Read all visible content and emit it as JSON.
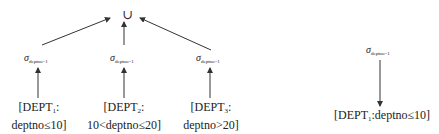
{
  "left_tree": {
    "root": {
      "symbol": "∪"
    },
    "selections": [
      {
        "sigma": "σ",
        "condition": "deptno=1"
      },
      {
        "sigma": "σ",
        "condition": "deptno=1"
      },
      {
        "sigma": "σ",
        "condition": "deptno=1"
      }
    ],
    "leaves": [
      {
        "name": "[DEPT",
        "sub": "1",
        "suffix": ":",
        "predicate": "deptno≤10]"
      },
      {
        "name": "[DEPT",
        "sub": "2",
        "suffix": ":",
        "predicate": "10<deptno≤20]"
      },
      {
        "name": "[DEPT",
        "sub": "3",
        "suffix": ":",
        "predicate": "deptno>20]"
      }
    ]
  },
  "right_tree": {
    "selection": {
      "sigma": "σ",
      "condition": "deptno=1"
    },
    "leaf": {
      "name": "[DEPT",
      "sub": "1",
      "suffix": ":deptno≤10]"
    }
  }
}
